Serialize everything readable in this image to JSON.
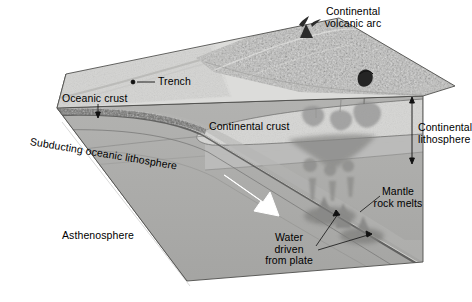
{
  "figure": {
    "type": "block-diagram",
    "background_color": "#ffffff"
  },
  "labels": {
    "continental_volcanic_arc": "Continental\nvolcanic arc",
    "trench": "Trench",
    "oceanic_crust": "Oceanic crust",
    "subducting_oceanic_lithosphere": "Subducting oceanic lithosphere",
    "continental_crust": "Continental crust",
    "continental_lithosphere": "Continental\nlithosphere",
    "mantle_rock_melts": "Mantle\nrock melts",
    "water_driven_from_plate": "Water\ndriven\nfrom plate",
    "asthenosphere": "Asthenosphere"
  },
  "colors": {
    "surface_light": "#d8d8d6",
    "mountain_mid": "#b9b9b7",
    "continental_crust": "#d2d2d0",
    "lithosphere_mantle": "#bfbfbd",
    "asthenosphere": "#ababa9",
    "side_face_dark": "#999997",
    "oceanic_crust_band": "#6e6e6c",
    "slab_line": "#4a4a48",
    "magma_plume": "#8e8e8c",
    "volcano_dark": "#2b2b2b",
    "arrow_white": "#ffffff",
    "leader_line": "#1a1a1a",
    "text": "#000000"
  },
  "features": {
    "motion_arrow": {
      "name": "subduction-direction-arrow",
      "color": "#ffffff",
      "direction": "down-right along slab"
    },
    "volcanoes": [
      {
        "name": "arc-volcano-summit"
      },
      {
        "name": "arc-volcano-flank"
      }
    ],
    "magma_bodies_count": 9,
    "bracket": {
      "name": "continental-lithosphere-thickness-bracket",
      "style": "double-headed vertical arrow"
    }
  }
}
